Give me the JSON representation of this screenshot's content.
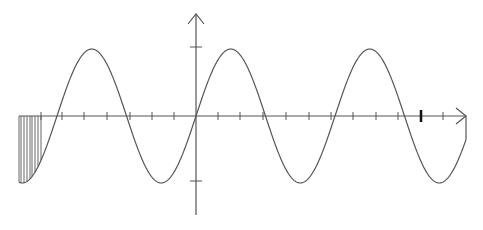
{
  "diagram": {
    "type": "sine-wave-plot",
    "colors": {
      "background": "#ffffff",
      "axis": "#555555",
      "curve": "#555555",
      "hatch": "#555555",
      "highlight_tick": "#111111"
    },
    "geometry": {
      "origin_x": 196,
      "origin_y": 116,
      "x_axis_start": 19,
      "x_axis_end": 466,
      "y_axis_top": 14,
      "y_axis_bottom": 215,
      "amplitude_px": 67,
      "period_px": 139,
      "curve_x_start": 19,
      "curve_x_end": 466
    },
    "x_ticks": [
      41,
      62,
      84,
      107,
      130,
      152,
      174,
      218,
      240,
      263,
      286,
      309,
      331,
      353,
      376,
      398,
      443
    ],
    "highlighted_x_tick": 421,
    "y_ticks": [
      47,
      181
    ],
    "hatched_region": {
      "x_start": 19,
      "x_end": 41,
      "lines_x": [
        19,
        21,
        24,
        27,
        30,
        32,
        35,
        38,
        41
      ]
    }
  }
}
